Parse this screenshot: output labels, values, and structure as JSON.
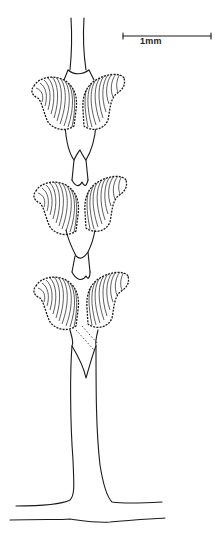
{
  "figure": {
    "scale_bar": {
      "label": "1mm",
      "x1": 123,
      "x2": 211,
      "y": 36
    },
    "segments": [
      {
        "name": "segment-1",
        "center_y": 100
      },
      {
        "name": "segment-2",
        "center_y": 215
      },
      {
        "name": "segment-3",
        "center_y": 310
      }
    ],
    "base_line_y": 523,
    "colors": {
      "ink": "#1a1a1a",
      "paper": "#ffffff"
    }
  }
}
